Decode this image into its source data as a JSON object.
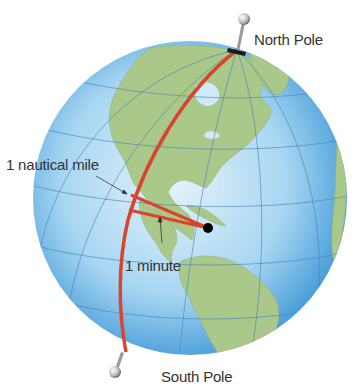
{
  "labels": {
    "north_pole": "North Pole",
    "south_pole": "South Pole",
    "nautical_mile": "1 nautical mile",
    "minute": "1 minute"
  },
  "colors": {
    "ocean_light": "#d6edf8",
    "ocean_mid": "#8cc8ec",
    "ocean_edge": "#3f9ad8",
    "land": "#a9c98a",
    "grid": "#4a86b8",
    "meridian_arc": "#d9442e",
    "text": "#333333"
  }
}
